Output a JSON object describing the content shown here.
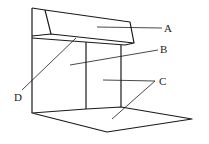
{
  "diagram": {
    "labels": {
      "A": "A",
      "B": "B",
      "C": "C",
      "D": "D"
    },
    "stroke_color": "#1a1a1a",
    "background": "#ffffff"
  }
}
